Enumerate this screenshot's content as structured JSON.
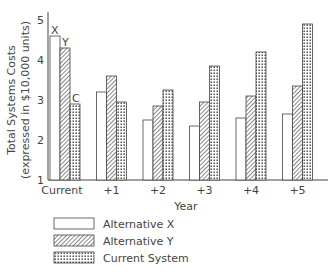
{
  "chart_data": {
    "type": "bar",
    "title": "",
    "xlabel": "Year",
    "ylabel": "Total Systems Costs",
    "ylabel_sub": "(expressed in $10,000 units)",
    "categories": [
      "Current",
      "+1",
      "+2",
      "+3",
      "+4",
      "+5"
    ],
    "yticks": [
      "1",
      "2",
      "3",
      "4",
      "5"
    ],
    "ylim": [
      1,
      5
    ],
    "series": [
      {
        "name": "Alternative X",
        "pattern": "blank",
        "values": [
          4.6,
          3.2,
          2.5,
          2.35,
          2.55,
          2.65
        ]
      },
      {
        "name": "Alternative Y",
        "pattern": "hatched",
        "values": [
          4.3,
          3.6,
          2.85,
          2.95,
          3.1,
          3.35
        ]
      },
      {
        "name": "Current System",
        "pattern": "dotted",
        "values": [
          2.9,
          2.95,
          3.25,
          3.85,
          4.2,
          4.9
        ]
      }
    ],
    "annotations": [
      "X",
      "Y",
      "C"
    ],
    "legend_position": "bottom-left",
    "grid": false
  }
}
